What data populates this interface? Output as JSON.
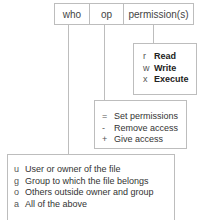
{
  "header": {
    "cells": [
      "who",
      "op",
      "permission(s)"
    ]
  },
  "permissions_box": {
    "items": [
      {
        "key": "r",
        "label": "Read"
      },
      {
        "key": "w",
        "label": "Write"
      },
      {
        "key": "x",
        "label": "Execute"
      }
    ]
  },
  "op_box": {
    "items": [
      {
        "key": "=",
        "label": "Set permissions"
      },
      {
        "key": "-",
        "label": "Remove access"
      },
      {
        "key": "+",
        "label": "Give access"
      }
    ]
  },
  "who_box": {
    "items": [
      {
        "key": "u",
        "label": "User or owner of the file"
      },
      {
        "key": "g",
        "label": "Group to which the file belongs"
      },
      {
        "key": "o",
        "label": "Others outside owner and group"
      },
      {
        "key": "a",
        "label": "All of the above"
      }
    ]
  },
  "colors": {
    "line": "#bdbdbd",
    "text": "#444444"
  }
}
